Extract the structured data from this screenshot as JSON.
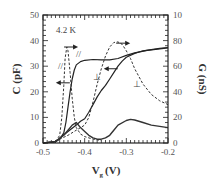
{
  "chart_data": {
    "type": "line",
    "title": "",
    "annotation_temperature": "4.2 K",
    "xlabel": "V_g (V)",
    "xlabel_main": "V",
    "xlabel_sub": "g",
    "xlabel_unit": "(V)",
    "ylabel_left": "C (pF)",
    "ylabel_right": "G (nS)",
    "xlim": [
      -0.5,
      -0.2
    ],
    "ylim_left": [
      0,
      50
    ],
    "ylim_right": [
      0,
      100
    ],
    "x_ticks": [
      "-0.5",
      "-0.4",
      "-0.3",
      "-0.2"
    ],
    "y_left_ticks": [
      "0",
      "10",
      "20",
      "30",
      "40",
      "50"
    ],
    "y_right_ticks": [
      "0",
      "20",
      "40",
      "60",
      "80",
      "10"
    ],
    "grid": false,
    "series": [
      {
        "name": "C parallel (//)",
        "axis": "left",
        "style": "solid",
        "x": [
          -0.5,
          -0.47,
          -0.46,
          -0.45,
          -0.445,
          -0.44,
          -0.435,
          -0.43,
          -0.425,
          -0.42,
          -0.41,
          -0.4,
          -0.38,
          -0.36,
          -0.34,
          -0.32,
          -0.3,
          -0.28,
          -0.25,
          -0.22,
          -0.2
        ],
        "values": [
          0,
          0.5,
          1.5,
          4,
          8,
          14,
          20,
          25,
          28.5,
          30.5,
          31.8,
          32.3,
          32.6,
          32.5,
          32.5,
          33,
          34.2,
          35.2,
          36.2,
          36.8,
          37.2
        ]
      },
      {
        "name": "G parallel (//)",
        "axis": "right",
        "style": "dashed",
        "x": [
          -0.5,
          -0.47,
          -0.46,
          -0.455,
          -0.45,
          -0.447,
          -0.443,
          -0.44,
          -0.435,
          -0.43,
          -0.425,
          -0.42,
          -0.41,
          -0.4,
          -0.38,
          -0.36
        ],
        "values": [
          0,
          1,
          6,
          20,
          45,
          66,
          75,
          72,
          55,
          35,
          20,
          12,
          7,
          5,
          3,
          2
        ]
      },
      {
        "name": "C perpendicular (⊥)",
        "axis": "left",
        "style": "solid",
        "x": [
          -0.5,
          -0.47,
          -0.46,
          -0.44,
          -0.42,
          -0.41,
          -0.4,
          -0.39,
          -0.38,
          -0.37,
          -0.36,
          -0.35,
          -0.34,
          -0.33,
          -0.32,
          -0.31,
          -0.3,
          -0.28,
          -0.26,
          -0.24,
          -0.22,
          -0.2
        ],
        "values": [
          0,
          0.5,
          2,
          4.5,
          7,
          8.5,
          9.5,
          12,
          15,
          18,
          20.5,
          22.5,
          25,
          27.5,
          30,
          32,
          33.5,
          35,
          36,
          36.5,
          37,
          37.3
        ]
      },
      {
        "name": "G perpendicular (⊥)",
        "axis": "right",
        "style": "dashed",
        "x": [
          -0.5,
          -0.47,
          -0.46,
          -0.44,
          -0.42,
          -0.4,
          -0.39,
          -0.38,
          -0.37,
          -0.36,
          -0.35,
          -0.34,
          -0.33,
          -0.32,
          -0.31,
          -0.3,
          -0.29,
          -0.28,
          -0.26,
          -0.24,
          -0.22,
          -0.2
        ],
        "values": [
          0,
          1,
          3,
          6,
          10,
          14,
          20,
          32,
          46,
          58,
          68,
          75,
          78.5,
          79,
          77,
          72,
          66,
          58,
          46,
          38,
          33,
          30
        ]
      },
      {
        "name": "G perpendicular low (noisy)",
        "axis": "left",
        "style": "solid-noisy",
        "x": [
          -0.5,
          -0.47,
          -0.45,
          -0.44,
          -0.43,
          -0.42,
          -0.41,
          -0.4,
          -0.39,
          -0.38,
          -0.37,
          -0.36,
          -0.35,
          -0.34,
          -0.33,
          -0.32,
          -0.3,
          -0.29,
          -0.28,
          -0.26,
          -0.24,
          -0.22,
          -0.2
        ],
        "values": [
          0,
          0.5,
          3,
          5,
          7,
          8,
          6,
          4.5,
          3,
          2,
          1.5,
          1.5,
          2,
          3,
          5,
          7,
          8.8,
          9.2,
          9,
          8,
          7,
          6.5,
          6
        ]
      }
    ],
    "annotations": [
      {
        "text": "//",
        "x": -0.458,
        "y_left": 29
      },
      {
        "text": "//",
        "x": -0.415,
        "y_left": 33.5
      },
      {
        "text": "⊥",
        "x": -0.37,
        "y_left": 24.5
      },
      {
        "text": "⊥",
        "x": -0.275,
        "y_left": 22
      }
    ],
    "arrows": [
      {
        "direction": "right",
        "x": -0.435,
        "y_left": 37.5
      },
      {
        "direction": "left",
        "x": -0.45,
        "y_left": 23.5
      },
      {
        "direction": "right",
        "x": -0.31,
        "y_left": 39
      },
      {
        "direction": "left",
        "x": -0.335,
        "y_left": 29
      }
    ]
  }
}
